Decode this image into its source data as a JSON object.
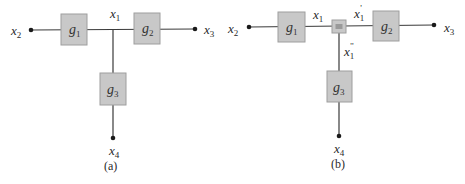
{
  "diagrams": [
    {
      "id": "a",
      "caption": "(a)",
      "blocks": [
        {
          "name": "g",
          "sub": "1"
        },
        {
          "name": "g",
          "sub": "2"
        },
        {
          "name": "g",
          "sub": "3"
        }
      ],
      "variables": [
        {
          "name": "x",
          "sub": "1",
          "prime": ""
        },
        {
          "name": "x",
          "sub": "2",
          "prime": ""
        },
        {
          "name": "x",
          "sub": "3",
          "prime": ""
        },
        {
          "name": "x",
          "sub": "4",
          "prime": ""
        }
      ]
    },
    {
      "id": "b",
      "caption": "(b)",
      "blocks": [
        {
          "name": "g",
          "sub": "1"
        },
        {
          "name": "g",
          "sub": "2"
        },
        {
          "name": "g",
          "sub": "3"
        },
        {
          "name": "=",
          "sub": ""
        }
      ],
      "variables": [
        {
          "name": "x",
          "sub": "1",
          "prime": ""
        },
        {
          "name": "x",
          "sub": "1",
          "prime": "'"
        },
        {
          "name": "x",
          "sub": "1",
          "prime": "''"
        },
        {
          "name": "x",
          "sub": "2",
          "prime": ""
        },
        {
          "name": "x",
          "sub": "3",
          "prime": ""
        },
        {
          "name": "x",
          "sub": "4",
          "prime": ""
        }
      ]
    }
  ],
  "colors": {
    "block_fill": "#c8c8c8",
    "block_stroke": "#9e9e9e",
    "wire": "#3a3a3a",
    "text": "#2a2a2a"
  }
}
